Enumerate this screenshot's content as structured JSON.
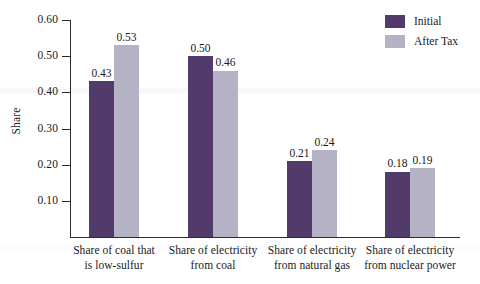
{
  "chart_data": {
    "type": "bar",
    "title": "",
    "xlabel": "",
    "ylabel": "Share",
    "ylim": [
      0,
      0.6
    ],
    "ytick_step": 0.1,
    "grid": false,
    "legend_position": "top-right",
    "categories": [
      "Share of coal that is low-sulfur",
      "Share of electricity from coal",
      "Share of electricity from natural gas",
      "Share of electricity from nuclear power"
    ],
    "category_lines": [
      [
        "Share of coal that",
        "is low-sulfur"
      ],
      [
        "Share of electricity",
        "from coal"
      ],
      [
        "Share of electricity",
        "from natural gas"
      ],
      [
        "Share of electricity",
        "from nuclear power"
      ]
    ],
    "ytick_labels": [
      "0.10",
      "0.20",
      "0.30",
      "0.40",
      "0.50",
      "0.60"
    ],
    "ytick_values": [
      0.1,
      0.2,
      0.3,
      0.4,
      0.5,
      0.6
    ],
    "series": [
      {
        "name": "Initial",
        "color": "#523A6B",
        "values": [
          0.43,
          0.5,
          0.21,
          0.18
        ],
        "labels": [
          "0.43",
          "0.50",
          "0.21",
          "0.18"
        ]
      },
      {
        "name": "After Tax",
        "color": "#B5B2C6",
        "values": [
          0.53,
          0.46,
          0.24,
          0.19
        ],
        "labels": [
          "0.53",
          "0.46",
          "0.24",
          "0.19"
        ]
      }
    ]
  },
  "legend": {
    "items": [
      {
        "label": "Initial",
        "color": "#523A6B"
      },
      {
        "label": "After Tax",
        "color": "#B5B2C6"
      }
    ]
  }
}
